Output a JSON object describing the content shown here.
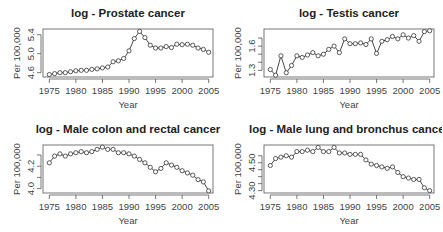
{
  "chart_data": [
    {
      "type": "line",
      "title": "log - Prostate cancer",
      "xlabel": "Year",
      "ylabel": "Per 100,000",
      "x": [
        1975,
        1976,
        1977,
        1978,
        1979,
        1980,
        1981,
        1982,
        1983,
        1984,
        1985,
        1986,
        1987,
        1988,
        1989,
        1990,
        1991,
        1992,
        1993,
        1994,
        1995,
        1996,
        1997,
        1998,
        1999,
        2000,
        2001,
        2002,
        2003,
        2004,
        2005
      ],
      "values": [
        4.56,
        4.58,
        4.6,
        4.6,
        4.62,
        4.64,
        4.65,
        4.65,
        4.67,
        4.68,
        4.7,
        4.72,
        4.83,
        4.85,
        4.9,
        5.06,
        5.32,
        5.47,
        5.34,
        5.18,
        5.12,
        5.12,
        5.15,
        5.13,
        5.2,
        5.19,
        5.2,
        5.18,
        5.12,
        5.09,
        5.03
      ],
      "xticks": [
        1975,
        1980,
        1985,
        1990,
        1995,
        2000,
        2005
      ],
      "yticks": [
        4.6,
        5.0,
        5.4
      ],
      "ytick_labels": [
        "4.6",
        "5.0",
        "5.4"
      ],
      "ylim": [
        4.53,
        5.5
      ],
      "grid": false
    },
    {
      "type": "line",
      "title": "log - Testis cancer",
      "xlabel": "Year",
      "ylabel": "Per 100,000",
      "x": [
        1975,
        1976,
        1977,
        1978,
        1979,
        1980,
        1981,
        1982,
        1983,
        1984,
        1985,
        1986,
        1987,
        1988,
        1989,
        1990,
        1991,
        1992,
        1993,
        1994,
        1995,
        1996,
        1997,
        1998,
        1999,
        2000,
        2001,
        2002,
        2003,
        2004,
        2005
      ],
      "values": [
        1.31,
        1.24,
        1.48,
        1.27,
        1.36,
        1.48,
        1.46,
        1.49,
        1.52,
        1.48,
        1.5,
        1.56,
        1.6,
        1.52,
        1.69,
        1.63,
        1.63,
        1.64,
        1.62,
        1.69,
        1.51,
        1.66,
        1.68,
        1.72,
        1.69,
        1.74,
        1.7,
        1.73,
        1.66,
        1.78,
        1.79
      ],
      "xticks": [
        1975,
        1980,
        1985,
        1990,
        1995,
        2000,
        2005
      ],
      "yticks": [
        1.3,
        1.4,
        1.5,
        1.6,
        1.7
      ],
      "ytick_labels": [
        "1.3",
        "",
        "",
        "1.6",
        ""
      ],
      "ylim": [
        1.23,
        1.8
      ],
      "grid": false
    },
    {
      "type": "line",
      "title": "log - Male colon and rectal cancer",
      "xlabel": "Year",
      "ylabel": "Per 100,000",
      "x": [
        1975,
        1976,
        1977,
        1978,
        1979,
        1980,
        1981,
        1982,
        1983,
        1984,
        1985,
        1986,
        1987,
        1988,
        1989,
        1990,
        1991,
        1992,
        1993,
        1994,
        1995,
        1996,
        1997,
        1998,
        1999,
        2000,
        2001,
        2002,
        2003,
        2004,
        2005
      ],
      "values": [
        4.23,
        4.29,
        4.31,
        4.29,
        4.31,
        4.32,
        4.33,
        4.32,
        4.33,
        4.35,
        4.37,
        4.35,
        4.35,
        4.32,
        4.32,
        4.31,
        4.29,
        4.26,
        4.23,
        4.19,
        4.15,
        4.18,
        4.23,
        4.21,
        4.19,
        4.16,
        4.14,
        4.12,
        4.08,
        4.06,
        3.98
      ],
      "xticks": [
        1975,
        1980,
        1985,
        1990,
        1995,
        2000,
        2005
      ],
      "yticks": [
        4.0,
        4.1,
        4.2,
        4.3
      ],
      "ytick_labels": [
        "4.0",
        "",
        "4.2",
        ""
      ],
      "ylim": [
        3.97,
        4.38
      ],
      "grid": false
    },
    {
      "type": "line",
      "title": "log - Male lung and bronchus cancer",
      "xlabel": "Year",
      "ylabel": "Per 100,000",
      "x": [
        1975,
        1976,
        1977,
        1978,
        1979,
        1980,
        1981,
        1982,
        1983,
        1984,
        1985,
        1986,
        1987,
        1988,
        1989,
        1990,
        1991,
        1992,
        1993,
        1994,
        1995,
        1996,
        1997,
        1998,
        1999,
        2000,
        2001,
        2002,
        2003,
        2004,
        2005
      ],
      "values": [
        4.48,
        4.53,
        4.54,
        4.55,
        4.54,
        4.58,
        4.58,
        4.59,
        4.58,
        4.61,
        4.58,
        4.58,
        4.61,
        4.57,
        4.57,
        4.56,
        4.56,
        4.56,
        4.52,
        4.49,
        4.48,
        4.47,
        4.46,
        4.47,
        4.43,
        4.4,
        4.39,
        4.38,
        4.38,
        4.32,
        4.3
      ],
      "xticks": [
        1975,
        1980,
        1985,
        1990,
        1995,
        2000,
        2005
      ],
      "yticks": [
        4.3,
        4.35,
        4.4,
        4.45,
        4.5,
        4.55
      ],
      "ytick_labels": [
        "4.30",
        "",
        "",
        "",
        "4.50",
        ""
      ],
      "ylim": [
        4.29,
        4.62
      ],
      "grid": false
    }
  ],
  "style": {
    "line_color": "#333333",
    "marker_color": "#333333",
    "frame_color": "#555555",
    "background": "#ffffff"
  }
}
